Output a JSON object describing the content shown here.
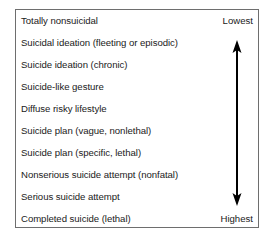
{
  "diagram": {
    "type": "spectrum-scale",
    "items": [
      {
        "label": "Totally nonsuicidal"
      },
      {
        "label": "Suicidal ideation (fleeting or episodic)"
      },
      {
        "label": "Suicide ideation (chronic)"
      },
      {
        "label": "Suicide-like gesture"
      },
      {
        "label": "Diffuse risky lifestyle"
      },
      {
        "label": "Suicide plan (vague, nonlethal)"
      },
      {
        "label": "Suicide plan (specific, lethal)"
      },
      {
        "label": "Nonserious suicide attempt (nonfatal)"
      },
      {
        "label": "Serious suicide attempt"
      },
      {
        "label": "Completed suicide (lethal)"
      }
    ],
    "scale": {
      "top_label": "Lowest",
      "bottom_label": "Highest",
      "arrow": "double-headed-vertical"
    },
    "colors": {
      "border": "#6e6e6e",
      "text": "#1a1a1a",
      "arrow": "#000000",
      "background": "#ffffff"
    }
  }
}
